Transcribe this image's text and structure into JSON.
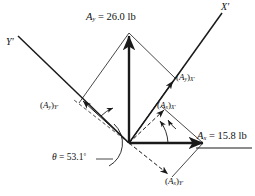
{
  "figure": {
    "type": "vector-decomposition-diagram",
    "background": "#ffffff",
    "stroke_color": "#1a1a1a"
  },
  "axes": {
    "x_prime": {
      "label": "X",
      "prime": "′",
      "angle_deg": 37
    },
    "y_prime": {
      "label": "Y",
      "prime": "′",
      "angle_deg": 127
    }
  },
  "angle": {
    "symbol": "θ",
    "equals": "=",
    "value": "53.1",
    "unit": "°",
    "text": "θ = 53.1°"
  },
  "vectors": {
    "a_y": {
      "name": "A",
      "sub": "y",
      "equals": "=",
      "value": "26.0",
      "unit": "lb",
      "text": "A_y = 26.0 lb",
      "direction": "up",
      "weight": "bold"
    },
    "a_x": {
      "name": "A",
      "sub": "x",
      "equals": "=",
      "value": "15.8",
      "unit": "lb",
      "text": "A_x = 15.8 lb",
      "direction": "right",
      "weight": "bold"
    }
  },
  "components": {
    "ay_on_xprime": {
      "open": "(",
      "name": "A",
      "sub": "y",
      "close": ")",
      "axis": "X",
      "prime": "′"
    },
    "ay_on_yprime": {
      "open": "(",
      "name": "A",
      "sub": "y",
      "close": ")",
      "axis": "Y",
      "prime": "′"
    },
    "ax_on_xprime": {
      "open": "(",
      "name": "A",
      "sub": "x",
      "close": ")",
      "axis": "X",
      "prime": "′"
    },
    "ax_on_yprime": {
      "open": "(",
      "name": "A",
      "sub": "x",
      "close": ")",
      "axis": "Y",
      "prime": "′"
    }
  }
}
